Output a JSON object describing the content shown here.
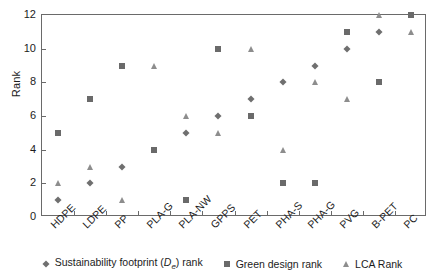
{
  "chart_data": {
    "type": "scatter",
    "title": "",
    "xlabel": "",
    "ylabel": "Rank",
    "ylim": [
      0,
      12
    ],
    "ytick_step": 2,
    "grid": false,
    "legend_position": "bottom",
    "categories": [
      "HDPE",
      "LDPE",
      "PP",
      "PLA-G",
      "PLA-NW",
      "GPPS",
      "PET",
      "PHA-S",
      "PHA-G",
      "PVG",
      "B-PET",
      "PC"
    ],
    "ytick_labels": [
      "0",
      "2",
      "4",
      "6",
      "8",
      "10",
      "12"
    ],
    "series": [
      {
        "name": "Sustainability footprint (De) rank",
        "marker": "diamond",
        "color": "#6f6f6f",
        "values": [
          1,
          2,
          3,
          null,
          5,
          6,
          7,
          8,
          9,
          10,
          11,
          null
        ]
      },
      {
        "name": "Green design rank",
        "marker": "square",
        "color": "#6a6a6a",
        "values": [
          5,
          7,
          9,
          4,
          1,
          10,
          6,
          2,
          2,
          11,
          8,
          12
        ]
      },
      {
        "name": "LCA Rank",
        "marker": "triangle",
        "color": "#8d8d8d",
        "values": [
          2,
          3,
          1,
          9,
          6,
          5,
          10,
          4,
          8,
          7,
          12,
          11
        ]
      }
    ]
  },
  "legend": {
    "items": [
      {
        "label_pre": "Sustainability footprint (",
        "label_var": "D",
        "label_sub": "e",
        "label_post": ") rank",
        "marker": "diamond"
      },
      {
        "label_pre": "Green design rank",
        "label_var": "",
        "label_sub": "",
        "label_post": "",
        "marker": "square"
      },
      {
        "label_pre": "LCA Rank",
        "label_var": "",
        "label_sub": "",
        "label_post": "",
        "marker": "triangle"
      }
    ]
  }
}
